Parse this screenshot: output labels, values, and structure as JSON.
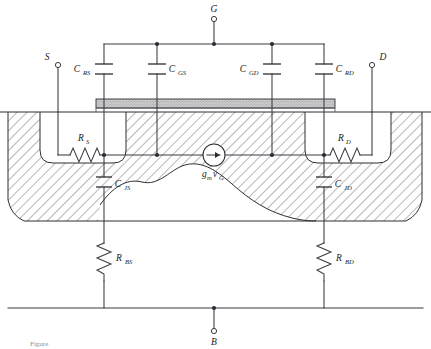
{
  "figure": {
    "type": "mosfet-small-signal-cross-section",
    "caption_fragment": "Figure"
  },
  "terminals": [
    {
      "id": "gate",
      "label": "G",
      "position": "top-center"
    },
    {
      "id": "source",
      "label": "S",
      "position": "upper-left"
    },
    {
      "id": "drain",
      "label": "D",
      "position": "upper-right"
    },
    {
      "id": "body",
      "label": "B",
      "position": "bottom-center"
    }
  ],
  "capacitors": [
    {
      "id": "c-rs",
      "symbol": "C",
      "subscript": "RS",
      "label": "C_RS",
      "label_side": "left",
      "orientation": "vertical"
    },
    {
      "id": "c-gs",
      "symbol": "C",
      "subscript": "GS",
      "label": "C_GS",
      "label_side": "right",
      "orientation": "vertical"
    },
    {
      "id": "c-gd",
      "symbol": "C",
      "subscript": "GD",
      "label": "C_GD",
      "label_side": "left",
      "orientation": "vertical"
    },
    {
      "id": "c-rd",
      "symbol": "C",
      "subscript": "RD",
      "label": "C_RD",
      "label_side": "right",
      "orientation": "vertical"
    },
    {
      "id": "c-js",
      "symbol": "C",
      "subscript": "JS",
      "label": "C_JS",
      "label_side": "right",
      "orientation": "vertical"
    },
    {
      "id": "c-jd",
      "symbol": "C",
      "subscript": "JD",
      "label": "C_JD",
      "label_side": "right",
      "orientation": "vertical"
    }
  ],
  "resistors": [
    {
      "id": "r-s",
      "symbol": "R",
      "subscript": "S",
      "label": "R_S",
      "orientation": "horizontal"
    },
    {
      "id": "r-d",
      "symbol": "R",
      "subscript": "D",
      "label": "R_D",
      "orientation": "horizontal"
    },
    {
      "id": "r-bs",
      "symbol": "R",
      "subscript": "BS",
      "label": "R_BS",
      "orientation": "vertical"
    },
    {
      "id": "r-bd",
      "symbol": "R",
      "subscript": "BD",
      "label": "R_BD",
      "orientation": "vertical"
    }
  ],
  "current_source": {
    "id": "gm-source",
    "label_gm": "g",
    "label_gm_sub": "m",
    "label_v": "v",
    "label_v_sub": "G",
    "label": "g_m v_G",
    "arrow_direction": "right"
  },
  "device_regions": [
    {
      "id": "substrate",
      "name": "substrate-bulk",
      "fill": "hatched"
    },
    {
      "id": "source-well",
      "name": "source-diffusion",
      "fill": "clear"
    },
    {
      "id": "drain-well",
      "name": "drain-diffusion",
      "fill": "clear"
    },
    {
      "id": "gate-oxide",
      "name": "gate-oxide-layer",
      "fill": "stippled"
    },
    {
      "id": "depletion",
      "name": "depletion-region",
      "fill": "clear"
    }
  ],
  "colors": {
    "line": "#2e2e34",
    "wire": "#3a3a42",
    "hatch": "#4a4a52",
    "oxide_fill": "#c9c9c9",
    "background": "#ffffff"
  }
}
